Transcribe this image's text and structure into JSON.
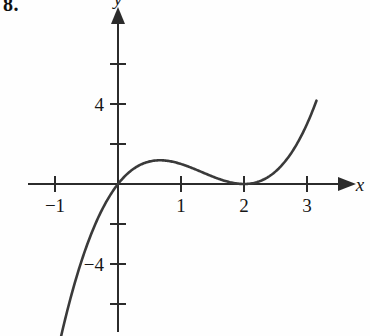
{
  "problem": {
    "label": "8."
  },
  "chart_data": {
    "type": "line",
    "title": "",
    "xlabel": "x",
    "ylabel": "y",
    "function": "y = x(x - 2)^2",
    "grid": false,
    "legend": null,
    "xlim": [
      -1.2,
      3.2
    ],
    "ylim": [
      -7.8,
      7.6
    ],
    "x_ticks": [
      -1,
      1,
      2,
      3
    ],
    "x_tick_labels": [
      "−1",
      "1",
      "2",
      "3"
    ],
    "x_unlabeled_ticks": [],
    "y_ticks": [
      -6,
      -4,
      -2,
      2,
      4,
      6
    ],
    "y_tick_labels": [
      "",
      "−4",
      "",
      "",
      "4",
      ""
    ],
    "x_roots": [
      0,
      2
    ],
    "local_max": {
      "x": 0.667,
      "y": 2.37
    },
    "local_min": {
      "x": 2,
      "y": 0
    },
    "points": [
      {
        "x": -1.17,
        "y": -7.6
      },
      {
        "x": -1.0,
        "y": -9.0
      },
      {
        "x": -0.8,
        "y": -6.27
      },
      {
        "x": -0.6,
        "y": -4.22
      },
      {
        "x": -0.4,
        "y": -2.3
      },
      {
        "x": -0.2,
        "y": -0.97
      },
      {
        "x": 0.0,
        "y": 0.0
      },
      {
        "x": 0.2,
        "y": 0.65
      },
      {
        "x": 0.4,
        "y": 1.02
      },
      {
        "x": 0.667,
        "y": 2.37
      },
      {
        "x": 0.8,
        "y": 1.15
      },
      {
        "x": 1.0,
        "y": 1.0
      },
      {
        "x": 1.2,
        "y": 0.77
      },
      {
        "x": 1.4,
        "y": 0.5
      },
      {
        "x": 1.6,
        "y": 0.26
      },
      {
        "x": 1.8,
        "y": 0.07
      },
      {
        "x": 2.0,
        "y": 0.0
      },
      {
        "x": 2.2,
        "y": 0.09
      },
      {
        "x": 2.4,
        "y": 0.38
      },
      {
        "x": 2.6,
        "y": 0.94
      },
      {
        "x": 2.8,
        "y": 1.79
      },
      {
        "x": 3.0,
        "y": 3.0
      },
      {
        "x": 3.15,
        "y": 4.2
      }
    ],
    "axes": {
      "x_arrow": true,
      "y_arrow": true,
      "x_axis_color": "#2b2b2b",
      "y_axis_color": "#2b2b2b",
      "curve_color": "#3a3a3a"
    }
  }
}
